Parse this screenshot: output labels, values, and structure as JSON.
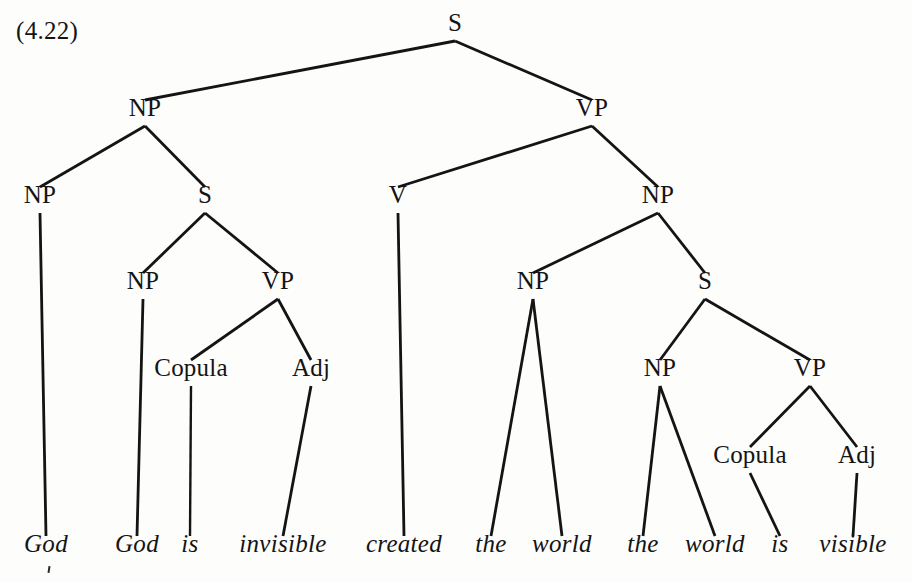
{
  "figure": {
    "example_number": "(4.22)",
    "ink_color": "#141414",
    "background_color": "#fdfdfc",
    "width": 912,
    "height": 582
  },
  "chart_data": {
    "type": "tree",
    "title": "(4.22)",
    "levels_y": [
      35,
      120,
      207,
      293,
      380,
      467,
      556
    ],
    "nodes": [
      {
        "id": "S0",
        "label": "S",
        "x": 455,
        "y": 35,
        "level": 0
      },
      {
        "id": "NP1",
        "label": "NP",
        "x": 145,
        "y": 120,
        "level": 1
      },
      {
        "id": "VP1",
        "label": "VP",
        "x": 592,
        "y": 120,
        "level": 1
      },
      {
        "id": "NP2",
        "label": "NP",
        "x": 40,
        "y": 207,
        "level": 2
      },
      {
        "id": "S1",
        "label": "S",
        "x": 205,
        "y": 207,
        "level": 2
      },
      {
        "id": "V1",
        "label": "V",
        "x": 398,
        "y": 207,
        "level": 2
      },
      {
        "id": "NP3",
        "label": "NP",
        "x": 658,
        "y": 207,
        "level": 2
      },
      {
        "id": "NP4",
        "label": "NP",
        "x": 143,
        "y": 293,
        "level": 3
      },
      {
        "id": "VP2",
        "label": "VP",
        "x": 278,
        "y": 293,
        "level": 3
      },
      {
        "id": "NP5",
        "label": "NP",
        "x": 533,
        "y": 293,
        "level": 3
      },
      {
        "id": "S2",
        "label": "S",
        "x": 705,
        "y": 293,
        "level": 3
      },
      {
        "id": "COP1",
        "label": "Copula",
        "x": 191,
        "y": 380,
        "level": 4
      },
      {
        "id": "ADJ1",
        "label": "Adj",
        "x": 311,
        "y": 380,
        "level": 4
      },
      {
        "id": "NP6",
        "label": "NP",
        "x": 660,
        "y": 380,
        "level": 4
      },
      {
        "id": "VP3",
        "label": "VP",
        "x": 810,
        "y": 380,
        "level": 4
      },
      {
        "id": "COP2",
        "label": "Copula",
        "x": 750,
        "y": 467,
        "level": 5
      },
      {
        "id": "ADJ2",
        "label": "Adj",
        "x": 857,
        "y": 467,
        "level": 5
      }
    ],
    "leaves": [
      {
        "id": "W1",
        "label": "God",
        "x": 46,
        "y": 556
      },
      {
        "id": "W2",
        "label": "God",
        "x": 137,
        "y": 556
      },
      {
        "id": "W3",
        "label": "is",
        "x": 190,
        "y": 556
      },
      {
        "id": "W4",
        "label": "invisible",
        "x": 283,
        "y": 556
      },
      {
        "id": "W5",
        "label": "created",
        "x": 404,
        "y": 556
      },
      {
        "id": "W6",
        "label": "the",
        "x": 491,
        "y": 556
      },
      {
        "id": "W7",
        "label": "world",
        "x": 562,
        "y": 556
      },
      {
        "id": "W8",
        "label": "the",
        "x": 643,
        "y": 556
      },
      {
        "id": "W9",
        "label": "world",
        "x": 715,
        "y": 556
      },
      {
        "id": "W10",
        "label": "is",
        "x": 780,
        "y": 556
      },
      {
        "id": "W11",
        "label": "visible",
        "x": 853,
        "y": 556
      }
    ],
    "edges": [
      {
        "from": "S0",
        "to": "NP1"
      },
      {
        "from": "S0",
        "to": "VP1"
      },
      {
        "from": "NP1",
        "to": "NP2"
      },
      {
        "from": "NP1",
        "to": "S1"
      },
      {
        "from": "VP1",
        "to": "V1"
      },
      {
        "from": "VP1",
        "to": "NP3"
      },
      {
        "from": "S1",
        "to": "NP4"
      },
      {
        "from": "S1",
        "to": "VP2"
      },
      {
        "from": "NP3",
        "to": "NP5"
      },
      {
        "from": "NP3",
        "to": "S2"
      },
      {
        "from": "VP2",
        "to": "COP1"
      },
      {
        "from": "VP2",
        "to": "ADJ1"
      },
      {
        "from": "S2",
        "to": "NP6"
      },
      {
        "from": "S2",
        "to": "VP3"
      },
      {
        "from": "NP2",
        "to": "W1"
      },
      {
        "from": "NP4",
        "to": "W2"
      },
      {
        "from": "COP1",
        "to": "W3"
      },
      {
        "from": "ADJ1",
        "to": "W4"
      },
      {
        "from": "V1",
        "to": "W5"
      },
      {
        "from": "NP5",
        "to": "W6"
      },
      {
        "from": "NP5",
        "to": "W7"
      },
      {
        "from": "VP3",
        "to": "COP2"
      },
      {
        "from": "VP3",
        "to": "ADJ2"
      },
      {
        "from": "NP6",
        "to": "W8"
      },
      {
        "from": "NP6",
        "to": "W9"
      },
      {
        "from": "COP2",
        "to": "W10"
      },
      {
        "from": "ADJ2",
        "to": "W11"
      }
    ],
    "sentence": "God, God is invisible, created the world, the world is visible"
  }
}
